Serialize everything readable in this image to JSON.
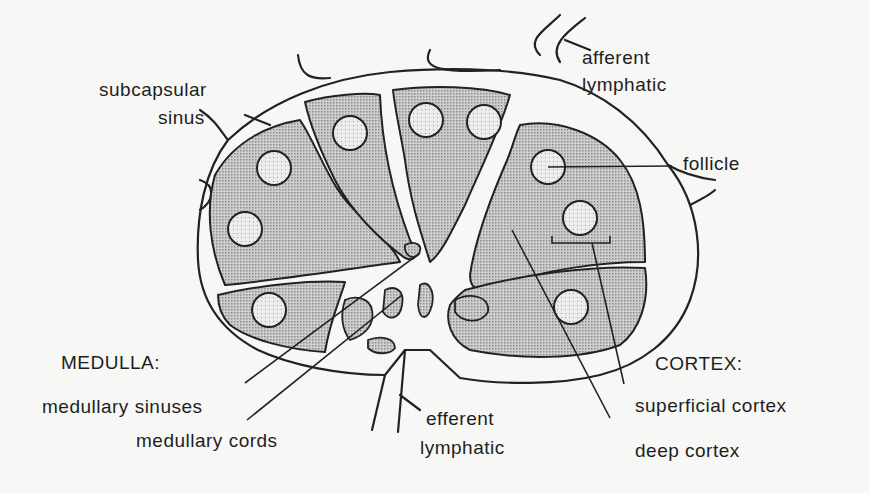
{
  "diagram": {
    "colors": {
      "background": "#f7f7f5",
      "outline": "#222222",
      "cortex_fill": "#b8b8b8",
      "follicle_fill": "#e4e4e4",
      "sinus_fill": "#f7f7f5"
    },
    "labels": {
      "subcapsular_sinus_line1": "subcapsular",
      "subcapsular_sinus_line2": "sinus",
      "afferent_line1": "afferent",
      "afferent_line2": "lymphatic",
      "follicle": "follicle",
      "medulla_heading": "MEDULLA:",
      "medullary_sinuses": "medullary sinuses",
      "medullary_cords": "medullary cords",
      "efferent_line1": "efferent",
      "efferent_line2": "lymphatic",
      "cortex_heading": "CORTEX:",
      "superficial_cortex": "superficial cortex",
      "deep_cortex": "deep cortex"
    }
  }
}
